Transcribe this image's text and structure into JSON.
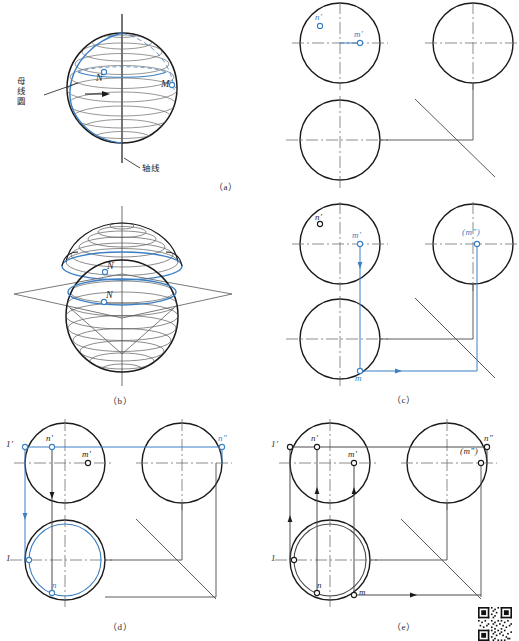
{
  "figure": {
    "accent_blue": "#3b7fc4",
    "line_black": "#1a1a1a",
    "line_gray": "#6f6f6f",
    "background": "#ffffff"
  },
  "panels": [
    {
      "id": "a",
      "caption": "（a）",
      "kind": "pictorial-and-projection",
      "pictorial": {
        "annotations": [
          {
            "name": "generating-circle-label",
            "text": "母\n线\n圆",
            "points_to": "blue meridian circle"
          },
          {
            "name": "axis-label",
            "text": "轴线",
            "points_to": "vertical rotation axis"
          }
        ],
        "points": [
          {
            "label": "N",
            "style": "open-circle",
            "color": "#3b7fc4"
          },
          {
            "label": "M",
            "style": "open-circle",
            "color": "#3b7fc4"
          }
        ],
        "rotation_arrow": true,
        "latitude_circles": 9
      },
      "projection": {
        "views": [
          "front",
          "side",
          "top"
        ],
        "miter_line": true,
        "points": [
          {
            "label": "n′",
            "view": "front",
            "color": "#3b7fc4",
            "marker": "open-circle"
          },
          {
            "label": "m′",
            "view": "front",
            "color": "#3b7fc4",
            "marker": "open-circle"
          }
        ]
      }
    },
    {
      "id": "b",
      "caption": "（b）",
      "kind": "pictorial",
      "pictorial": {
        "description": "sphere cut by horizontal plane, cap lifted above",
        "points": [
          {
            "label": "N",
            "on": "lifted-cap",
            "marker": "open-circle"
          },
          {
            "label": "N",
            "on": "sphere-section-circle",
            "marker": "open-circle"
          }
        ],
        "cutting_plane": true,
        "latitude_circles": 12
      }
    },
    {
      "id": "c",
      "caption": "（c）",
      "kind": "projection",
      "projection": {
        "views": [
          "front",
          "side",
          "top"
        ],
        "miter_line": true,
        "points": [
          {
            "label": "n′",
            "view": "front",
            "color": "#1a1a1a",
            "marker": "open-circle"
          },
          {
            "label": "m′",
            "view": "front",
            "color": "#3b7fc4",
            "marker": "open-circle"
          },
          {
            "label": "m",
            "view": "top",
            "color": "#3b7fc4",
            "marker": "open-circle"
          },
          {
            "label": "(m″)",
            "view": "side",
            "color": "#3b7fc4",
            "marker": "open-circle"
          }
        ],
        "projection_lines": [
          {
            "from": "m′",
            "to": "m",
            "direction": "down",
            "color": "#3b7fc4",
            "arrow": true
          },
          {
            "from": "m",
            "to": "miter",
            "direction": "right",
            "color": "#3b7fc4",
            "arrow": true
          },
          {
            "from": "miter",
            "to": "(m″)",
            "direction": "up",
            "color": "#3b7fc4",
            "arrow": false
          }
        ]
      }
    },
    {
      "id": "d",
      "caption": "（d）",
      "kind": "projection",
      "projection": {
        "views": [
          "front",
          "side",
          "top"
        ],
        "miter_line": true,
        "auxiliary_circle": {
          "view": "top",
          "color": "#3b7fc4"
        },
        "points": [
          {
            "label": "1′",
            "view": "front",
            "color": "#3b7fc4",
            "marker": "open-circle"
          },
          {
            "label": "n′",
            "view": "front",
            "color": "#3b7fc4",
            "marker": "open-circle"
          },
          {
            "label": "m′",
            "view": "front",
            "color": "#1a1a1a",
            "marker": "open-circle"
          },
          {
            "label": "n″",
            "view": "side",
            "color": "#3b7fc4",
            "marker": "open-circle"
          },
          {
            "label": "1",
            "view": "top",
            "color": "#3b7fc4",
            "marker": "open-circle"
          },
          {
            "label": "n",
            "view": "top",
            "color": "#3b7fc4",
            "marker": "open-circle"
          }
        ],
        "projection_lines": [
          {
            "from": "1′",
            "to": "n″",
            "direction": "right",
            "color": "#3b7fc4",
            "arrow": false
          },
          {
            "from": "n′",
            "to": "n",
            "direction": "down",
            "color": "#1a1a1a",
            "arrow": true
          },
          {
            "from": "1′",
            "to": "1",
            "direction": "down",
            "color": "#3b7fc4",
            "arrow": true
          }
        ]
      }
    },
    {
      "id": "e",
      "caption": "（e）",
      "kind": "projection",
      "projection": {
        "views": [
          "front",
          "side",
          "top"
        ],
        "miter_line": true,
        "auxiliary_circle": {
          "view": "top",
          "color": "#1a1a1a"
        },
        "points": [
          {
            "label": "1′",
            "view": "front",
            "color": "#1a1a1a",
            "marker": "open-circle"
          },
          {
            "label": "n′",
            "view": "front",
            "color": "#1a1a1a",
            "marker": "open-circle"
          },
          {
            "label": "m′",
            "view": "front",
            "color": "#1a1a1a",
            "marker": "open-circle"
          },
          {
            "label": "n″",
            "view": "side",
            "color": "#1a1a1a",
            "marker": "open-circle"
          },
          {
            "label": "(m″)",
            "view": "side",
            "color": "#1a1a1a",
            "marker": "open-circle"
          },
          {
            "label": "1",
            "view": "top",
            "color": "#1a1a1a",
            "marker": "open-circle"
          },
          {
            "label": "n",
            "view": "top",
            "color": "#1a1a1a",
            "marker": "open-circle"
          },
          {
            "label": "m",
            "view": "top",
            "color": "#1a1a1a",
            "marker": "open-circle"
          }
        ],
        "projection_lines": [
          {
            "from": "1′",
            "to": "n″",
            "direction": "right",
            "arrow": false
          },
          {
            "from": "n′",
            "to": "n",
            "direction": "up",
            "arrow": true
          },
          {
            "from": "m′",
            "to": "m",
            "direction": "up",
            "arrow": true
          },
          {
            "from": "1′",
            "to": "1",
            "direction": "up",
            "arrow": true
          },
          {
            "from": "m",
            "to": "miter",
            "direction": "right",
            "arrow": true
          }
        ]
      }
    }
  ],
  "qr_code": {
    "present": true,
    "name": "qr-code"
  }
}
